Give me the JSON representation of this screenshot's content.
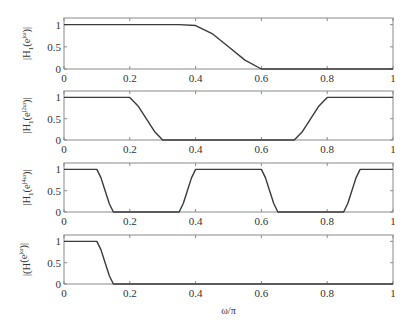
{
  "chart_data": [
    {
      "type": "line",
      "ylabel": "|H1(e^{jω})|",
      "ylabel_main": "|H",
      "ylabel_sub": "1",
      "ylabel_tail": "(e",
      "ylabel_sup": "jω",
      "ylabel_end": ")|",
      "x": [
        0,
        0.35,
        0.4,
        0.45,
        0.5,
        0.55,
        0.6,
        1.0
      ],
      "values": [
        1,
        1,
        0.98,
        0.8,
        0.5,
        0.2,
        0.0,
        0.0
      ],
      "xlim": [
        0,
        1
      ],
      "ylim": [
        0,
        1.15
      ],
      "xticks": [
        "0",
        "0.2",
        "0.4",
        "0.6",
        "0.8",
        "1"
      ],
      "yticks": [
        "0",
        "0.5",
        "1"
      ]
    },
    {
      "type": "line",
      "ylabel": "|H1(e^{j2ω})|",
      "ylabel_main": "|H",
      "ylabel_sub": "1",
      "ylabel_tail": "(e",
      "ylabel_sup": "j2ω",
      "ylabel_end": ")|",
      "x": [
        0,
        0.2,
        0.225,
        0.25,
        0.275,
        0.3,
        0.7,
        0.725,
        0.75,
        0.775,
        0.8,
        1.0
      ],
      "values": [
        1,
        1,
        0.8,
        0.5,
        0.2,
        0,
        0,
        0.2,
        0.5,
        0.8,
        1,
        1
      ],
      "xlim": [
        0,
        1
      ],
      "ylim": [
        0,
        1.15
      ],
      "xticks": [
        "0",
        "0.2",
        "0.4",
        "0.6",
        "0.8",
        "1"
      ],
      "yticks": [
        "0",
        "0.5",
        "1"
      ]
    },
    {
      "type": "line",
      "ylabel": "|H1(e^{j4ω})|",
      "ylabel_main": "|H",
      "ylabel_sub": "1",
      "ylabel_tail": "(e",
      "ylabel_sup": "j4ω",
      "ylabel_end": ")|",
      "x": [
        0,
        0.1,
        0.1125,
        0.125,
        0.1375,
        0.15,
        0.35,
        0.3625,
        0.375,
        0.3875,
        0.4,
        0.6,
        0.6125,
        0.625,
        0.6375,
        0.65,
        0.85,
        0.8625,
        0.875,
        0.8875,
        0.9,
        1.0
      ],
      "values": [
        1,
        1,
        0.8,
        0.5,
        0.2,
        0,
        0,
        0.2,
        0.5,
        0.8,
        1,
        1,
        0.8,
        0.5,
        0.2,
        0,
        0,
        0.2,
        0.5,
        0.8,
        1,
        1
      ],
      "xlim": [
        0,
        1
      ],
      "ylim": [
        0,
        1.15
      ],
      "xticks": [
        "0",
        "0.2",
        "0.4",
        "0.6",
        "0.8",
        "1"
      ],
      "yticks": [
        "0",
        "0.5",
        "1"
      ]
    },
    {
      "type": "line",
      "ylabel": "|(H(e^{jω})|",
      "ylabel_main": "|(H",
      "ylabel_sub": "",
      "ylabel_tail": "(e",
      "ylabel_sup": "jω",
      "ylabel_end": ")|",
      "x": [
        0,
        0.1,
        0.1125,
        0.125,
        0.1375,
        0.15,
        1.0
      ],
      "values": [
        1,
        1,
        0.8,
        0.5,
        0.2,
        0,
        0
      ],
      "xlim": [
        0,
        1
      ],
      "ylim": [
        0,
        1.15
      ],
      "xticks": [
        "0",
        "0.2",
        "0.4",
        "0.6",
        "0.8",
        "1"
      ],
      "yticks": [
        "0",
        "0.5",
        "1"
      ],
      "xlabel": "ω/π"
    }
  ],
  "layout": {
    "plot_left": 64,
    "plot_right": 393,
    "panels": [
      {
        "top": 18,
        "bottom": 69
      },
      {
        "top": 91,
        "bottom": 140
      },
      {
        "top": 163,
        "bottom": 212
      },
      {
        "top": 235,
        "bottom": 284
      }
    ]
  },
  "colors": {
    "curve": "#3a3a3a",
    "frame": "#8a8a8a",
    "text": "#333333"
  }
}
